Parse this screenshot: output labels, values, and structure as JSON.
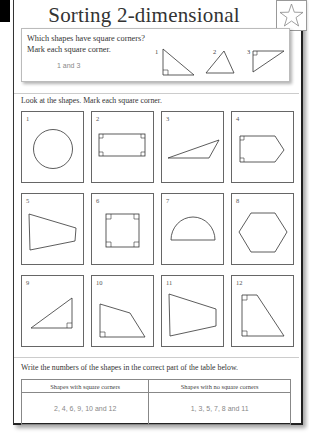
{
  "header": {
    "title": "Sorting 2-dimensional shapes",
    "star_icon": "star-icon"
  },
  "intro": {
    "question_line1": "Which shapes have square corners?",
    "question_line2": "Mark each square corner.",
    "answer": "1 and 3",
    "examples": [
      {
        "number": "1",
        "shape": "right-triangle",
        "square_corner": true
      },
      {
        "number": "2",
        "shape": "obtuse-triangle",
        "square_corner": false
      },
      {
        "number": "3",
        "shape": "right-triangle",
        "square_corner": true
      }
    ]
  },
  "section1": {
    "instruction": "Look at the shapes. Mark each square corner.",
    "shapes": [
      {
        "number": "1",
        "shape": "circle"
      },
      {
        "number": "2",
        "shape": "rectangle"
      },
      {
        "number": "3",
        "shape": "obtuse-triangle"
      },
      {
        "number": "4",
        "shape": "pentagon-arrow"
      },
      {
        "number": "5",
        "shape": "trapezoid"
      },
      {
        "number": "6",
        "shape": "square"
      },
      {
        "number": "7",
        "shape": "semicircle"
      },
      {
        "number": "8",
        "shape": "hexagon"
      },
      {
        "number": "9",
        "shape": "right-triangle"
      },
      {
        "number": "10",
        "shape": "quadrilateral"
      },
      {
        "number": "11",
        "shape": "quadrilateral"
      },
      {
        "number": "12",
        "shape": "right-trapezoid"
      }
    ]
  },
  "section2": {
    "instruction": "Write the numbers of the shapes in the correct part of the table below.",
    "table": {
      "headers": [
        "Shapes with square corners",
        "Shapes with no square corners"
      ],
      "answers": [
        "2, 4, 6, 9, 10 and 12",
        "1, 3, 5, 7, 8 and 11"
      ]
    }
  }
}
